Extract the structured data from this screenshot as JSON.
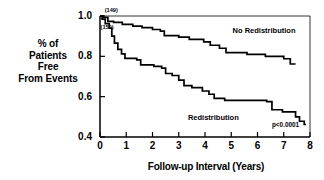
{
  "chart_data": {
    "type": "line",
    "title": "",
    "xlabel": "Follow-up Interval (Years)",
    "ylabel": "% of Patients Free From Events",
    "ylabel_lines": [
      "% of",
      "Patients",
      "Free",
      "From Events"
    ],
    "xlim": [
      0,
      8
    ],
    "ylim": [
      0.4,
      1.0
    ],
    "xticks": [
      0,
      1,
      2,
      3,
      4,
      5,
      6,
      7,
      8
    ],
    "xtick_labels": [
      "0",
      "1",
      "2",
      "3",
      "4",
      "5",
      "6",
      "7",
      "8"
    ],
    "yticks": [
      0.4,
      0.6,
      0.8,
      1.0
    ],
    "ytick_labels": [
      "0.4",
      "0.6",
      "0.8",
      "1.0"
    ],
    "grid": false,
    "legend_position": "inline-annotations",
    "curve_style": "kaplan-meier-step",
    "annotations": [
      {
        "name": "no-redistribution-n",
        "text": "(149)",
        "x": 0.18,
        "y": 1.02
      },
      {
        "name": "redistribution-n",
        "text": "(150)",
        "x": 0.02,
        "y": 0.935
      },
      {
        "name": "p-value",
        "text": "p<0.0001",
        "x": 6.55,
        "y": 0.455
      }
    ],
    "series": [
      {
        "name": "No Redistribution",
        "n": 149,
        "label_text": "No Redistribution",
        "label_x": 5.05,
        "label_y": 0.925,
        "color": "#000000",
        "points": [
          [
            0.0,
            1.0
          ],
          [
            0.12,
            1.0
          ],
          [
            0.12,
            0.993
          ],
          [
            0.3,
            0.993
          ],
          [
            0.3,
            0.973
          ],
          [
            0.52,
            0.973
          ],
          [
            0.52,
            0.968
          ],
          [
            0.85,
            0.968
          ],
          [
            0.85,
            0.958
          ],
          [
            1.25,
            0.958
          ],
          [
            1.25,
            0.95
          ],
          [
            1.6,
            0.95
          ],
          [
            1.6,
            0.942
          ],
          [
            2.0,
            0.942
          ],
          [
            2.0,
            0.933
          ],
          [
            2.3,
            0.933
          ],
          [
            2.3,
            0.925
          ],
          [
            2.45,
            0.925
          ],
          [
            2.45,
            0.903
          ],
          [
            3.0,
            0.903
          ],
          [
            3.0,
            0.895
          ],
          [
            3.4,
            0.895
          ],
          [
            3.4,
            0.884
          ],
          [
            3.95,
            0.884
          ],
          [
            3.95,
            0.872
          ],
          [
            4.2,
            0.872
          ],
          [
            4.2,
            0.855
          ],
          [
            4.55,
            0.855
          ],
          [
            4.55,
            0.84
          ],
          [
            4.8,
            0.84
          ],
          [
            4.8,
            0.818
          ],
          [
            5.6,
            0.818
          ],
          [
            5.6,
            0.81
          ],
          [
            6.3,
            0.81
          ],
          [
            6.3,
            0.8
          ],
          [
            7.0,
            0.8
          ],
          [
            7.0,
            0.788
          ],
          [
            7.25,
            0.788
          ],
          [
            7.25,
            0.762
          ],
          [
            7.45,
            0.762
          ]
        ]
      },
      {
        "name": "Redistribution",
        "n": 150,
        "label_text": "Redistribution",
        "label_x": 3.35,
        "label_y": 0.492,
        "color": "#000000",
        "points": [
          [
            0.0,
            1.0
          ],
          [
            0.08,
            1.0
          ],
          [
            0.08,
            0.985
          ],
          [
            0.2,
            0.985
          ],
          [
            0.2,
            0.962
          ],
          [
            0.35,
            0.962
          ],
          [
            0.35,
            0.94
          ],
          [
            0.45,
            0.94
          ],
          [
            0.45,
            0.9
          ],
          [
            0.55,
            0.9
          ],
          [
            0.55,
            0.865
          ],
          [
            0.68,
            0.865
          ],
          [
            0.68,
            0.835
          ],
          [
            0.82,
            0.835
          ],
          [
            0.82,
            0.812
          ],
          [
            0.95,
            0.812
          ],
          [
            0.95,
            0.79
          ],
          [
            1.4,
            0.79
          ],
          [
            1.4,
            0.782
          ],
          [
            1.55,
            0.782
          ],
          [
            1.55,
            0.758
          ],
          [
            2.05,
            0.758
          ],
          [
            2.05,
            0.75
          ],
          [
            2.35,
            0.75
          ],
          [
            2.35,
            0.742
          ],
          [
            2.5,
            0.742
          ],
          [
            2.5,
            0.715
          ],
          [
            2.75,
            0.715
          ],
          [
            2.75,
            0.705
          ],
          [
            3.0,
            0.705
          ],
          [
            3.0,
            0.682
          ],
          [
            3.2,
            0.682
          ],
          [
            3.2,
            0.655
          ],
          [
            3.5,
            0.655
          ],
          [
            3.5,
            0.645
          ],
          [
            3.9,
            0.645
          ],
          [
            3.9,
            0.628
          ],
          [
            4.15,
            0.628
          ],
          [
            4.15,
            0.612
          ],
          [
            4.35,
            0.612
          ],
          [
            4.35,
            0.592
          ],
          [
            4.75,
            0.592
          ],
          [
            4.75,
            0.582
          ],
          [
            6.35,
            0.582
          ],
          [
            6.35,
            0.575
          ],
          [
            6.55,
            0.575
          ],
          [
            6.55,
            0.535
          ],
          [
            6.95,
            0.535
          ],
          [
            6.95,
            0.525
          ],
          [
            7.45,
            0.525
          ],
          [
            7.45,
            0.5
          ],
          [
            7.6,
            0.5
          ],
          [
            7.6,
            0.478
          ],
          [
            7.78,
            0.478
          ],
          [
            7.78,
            0.462
          ],
          [
            7.85,
            0.462
          ]
        ]
      }
    ]
  }
}
